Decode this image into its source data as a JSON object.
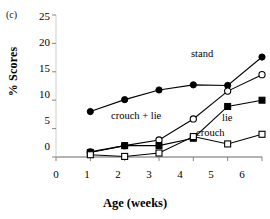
{
  "panel": {
    "label": "(c)"
  },
  "axes": {
    "x_title": "Age (weeks)",
    "y_title": "% Scores",
    "x_ticks": [
      "0",
      "1",
      "2",
      "3",
      "4",
      "5",
      "6"
    ],
    "y_ticks": [
      "0",
      "5",
      "10",
      "15",
      "20",
      "25"
    ]
  },
  "series_labels": {
    "stand": "stand",
    "crouch_plus_lie": "crouch  + lie",
    "lie": "lie",
    "crouch": "crouch"
  },
  "chart_data": {
    "type": "line",
    "title": "(c)",
    "xlabel": "Age (weeks)",
    "ylabel": "% Scores",
    "xlim": [
      0,
      6
    ],
    "ylim": [
      0,
      25
    ],
    "x": [
      1,
      2,
      3,
      4,
      5,
      6
    ],
    "xticks": [
      0,
      1,
      2,
      3,
      4,
      5,
      6
    ],
    "yticks": [
      0,
      5,
      10,
      15,
      20,
      25
    ],
    "grid": false,
    "legend_position": "inline-annotations",
    "series": [
      {
        "name": "stand",
        "marker": "filled-circle",
        "values": [
          8.0,
          10.1,
          11.8,
          12.7,
          12.6,
          17.6
        ]
      },
      {
        "name": "crouch  + lie",
        "marker": "open-circle",
        "values": [
          0.9,
          2.0,
          3.0,
          6.7,
          11.6,
          14.5
        ]
      },
      {
        "name": "lie",
        "marker": "filled-square",
        "values": [
          0.8,
          2.0,
          2.0,
          3.3,
          8.9,
          10.0
        ]
      },
      {
        "name": "crouch",
        "marker": "open-square",
        "values": [
          0.4,
          0.1,
          0.7,
          3.6,
          2.3,
          4.0
        ]
      }
    ]
  }
}
